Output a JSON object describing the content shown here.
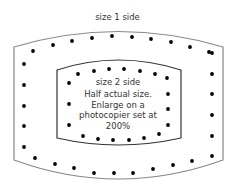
{
  "title": "size 1 side",
  "inner": {
    "label": "size 2 side",
    "description_lines": [
      "Half actual size.",
      "Enlarge on a",
      "photocopier set at",
      "200%"
    ]
  },
  "colors": {
    "outline": "#777777",
    "inner_outline": "#333333",
    "dot": "#000000",
    "text": "#333333"
  },
  "outer_dots": [
    [
      33,
      51
    ],
    [
      53,
      45
    ],
    [
      72,
      41
    ],
    [
      92,
      38
    ],
    [
      112,
      36
    ],
    [
      132,
      37
    ],
    [
      151,
      39
    ],
    [
      171,
      42
    ],
    [
      190,
      47
    ],
    [
      209,
      52
    ],
    [
      212,
      53
    ],
    [
      24,
      64
    ],
    [
      24,
      85
    ],
    [
      24,
      106
    ],
    [
      24,
      126
    ],
    [
      24,
      147
    ],
    [
      212,
      74
    ],
    [
      212,
      94
    ],
    [
      212,
      115
    ],
    [
      212,
      136
    ],
    [
      212,
      156
    ],
    [
      35,
      158
    ],
    [
      55,
      164
    ],
    [
      74,
      168
    ],
    [
      94,
      173
    ],
    [
      114,
      173
    ],
    [
      133,
      173
    ],
    [
      153,
      169
    ],
    [
      173,
      165
    ],
    [
      192,
      161
    ]
  ],
  "inner_dots": [
    [
      78,
      74
    ],
    [
      94,
      71
    ],
    [
      109,
      69
    ],
    [
      124,
      69
    ],
    [
      140,
      71
    ],
    [
      155,
      74
    ],
    [
      167,
      78
    ],
    [
      69,
      83
    ],
    [
      69,
      104
    ],
    [
      69,
      125
    ],
    [
      168,
      94
    ],
    [
      168,
      109
    ],
    [
      168,
      125
    ],
    [
      83,
      136
    ],
    [
      98,
      139
    ],
    [
      113,
      140
    ],
    [
      129,
      140
    ],
    [
      144,
      138
    ],
    [
      159,
      134
    ]
  ]
}
